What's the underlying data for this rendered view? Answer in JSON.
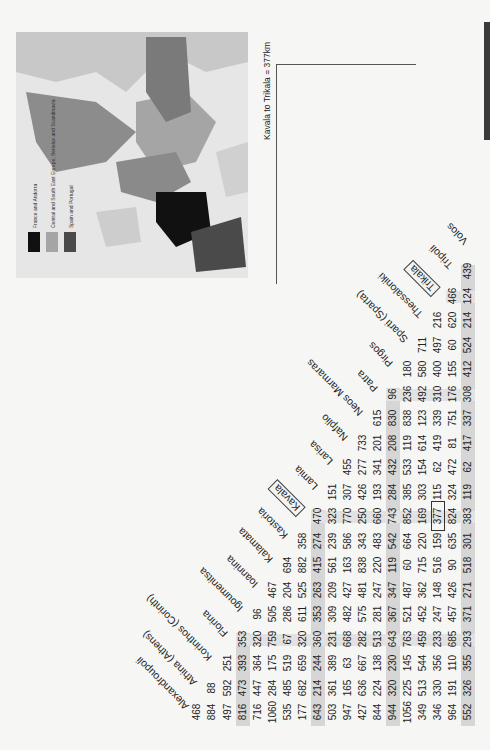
{
  "map": {
    "legend": [
      {
        "label": "France and Andorra",
        "color": "#111111"
      },
      {
        "label": "Central and South East Europe, Benelux and Scandinavia",
        "color": "#a5a5a5"
      },
      {
        "label": "Spain and Portugal",
        "color": "#4a4a4a"
      }
    ]
  },
  "table": {
    "note": "Kavala to Trikala = 377km",
    "highlight": {
      "from": "Kavala",
      "to": "Trikala",
      "value": 377
    },
    "cities": [
      "Alexandroupoli",
      "Athina (Athens)",
      "Korinthos (Corinth)",
      "Florina",
      "Igoumenitsa",
      "Ioannina",
      "Kalamata",
      "Kastoria",
      "Kavala",
      "Lamia",
      "Larisa",
      "Nafplio",
      "Neos Marmaras",
      "Patra",
      "Pirgos",
      "Sparti (Sparta)",
      "Thessaloniki",
      "Trikala",
      "Tripoli",
      "Volos"
    ],
    "boxed_cities": [
      "Kavala",
      "Trikala"
    ],
    "rows": [
      {
        "city": "Alexandroupoli",
        "values": [
          468,
          884,
          497,
          816,
          716,
          1060,
          535,
          177,
          643,
          503,
          947,
          427,
          844,
          944,
          1056,
          349,
          346,
          964,
          552
        ]
      },
      {
        "city": "Athina (Athens)",
        "values": [
          88,
          592,
          473,
          447,
          284,
          485,
          682,
          214,
          361,
          165,
          636,
          224,
          320,
          225,
          513,
          330,
          191,
          326
        ]
      },
      {
        "city": "Korinthos (Corinth)",
        "values": [
          251,
          393,
          364,
          175,
          519,
          659,
          244,
          389,
          63,
          667,
          138,
          230,
          145,
          544,
          356,
          110,
          355
        ]
      },
      {
        "city": "Florina",
        "values": [
          353,
          320,
          759,
          67,
          320,
          360,
          231,
          668,
          282,
          513,
          643,
          763,
          459,
          233,
          685,
          293
        ]
      },
      {
        "city": "Igoumenitsa",
        "values": [
          96,
          505,
          286,
          611,
          353,
          309,
          482,
          575,
          281,
          367,
          521,
          452,
          247,
          457,
          371
        ]
      },
      {
        "city": "Ioannina",
        "values": [
          467,
          204,
          525,
          263,
          209,
          427,
          481,
          247,
          347,
          487,
          362,
          148,
          426,
          271
        ]
      },
      {
        "city": "Kalamata",
        "values": [
          694,
          882,
          415,
          561,
          163,
          838,
          220,
          119,
          60,
          715,
          516,
          90,
          518
        ]
      },
      {
        "city": "Kastoria",
        "values": [
          358,
          274,
          239,
          586,
          343,
          483,
          542,
          664,
          220,
          159,
          635,
          301
        ]
      },
      {
        "city": "Kavala",
        "values": [
          470,
          323,
          770,
          250,
          660,
          743,
          852,
          169,
          377,
          824,
          383
        ]
      },
      {
        "city": "Lamia",
        "values": [
          151,
          307,
          426,
          193,
          284,
          385,
          303,
          115,
          324,
          119
        ]
      },
      {
        "city": "Larisa",
        "values": [
          455,
          277,
          341,
          432,
          533,
          154,
          62,
          472,
          62
        ]
      },
      {
        "city": "Nafplio",
        "values": [
          733,
          201,
          208,
          119,
          614,
          419,
          81,
          417
        ]
      },
      {
        "city": "Neos Marmaras",
        "values": [
          615,
          830,
          838,
          123,
          339,
          751,
          337
        ]
      },
      {
        "city": "Patra",
        "values": [
          96,
          236,
          492,
          310,
          176,
          308
        ]
      },
      {
        "city": "Pirgos",
        "values": [
          180,
          580,
          400,
          155,
          412
        ]
      },
      {
        "city": "Sparti (Sparta)",
        "values": [
          711,
          497,
          60,
          524
        ]
      },
      {
        "city": "Thessaloniki",
        "values": [
          216,
          620,
          214
        ]
      },
      {
        "city": "Trikala",
        "values": [
          466,
          124
        ]
      },
      {
        "city": "Tripoli",
        "values": [
          439
        ]
      }
    ]
  }
}
